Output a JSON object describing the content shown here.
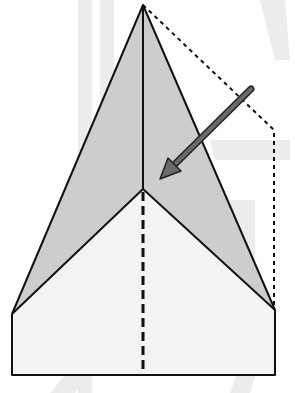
{
  "colors": {
    "background": "#ffffff",
    "watermark": "#ececec",
    "shaded_flap": "#cdcdcd",
    "paper": "#f3f3f3",
    "outline": "#111111",
    "arrow_fill": "#6a6a6a",
    "arrow_stroke": "#222222"
  },
  "shapes": {
    "apex": [
      143,
      5
    ],
    "center_point": [
      143,
      189
    ],
    "left_wing_corner": [
      12,
      314
    ],
    "right_wing_corner": [
      275,
      310
    ],
    "bottom_left": [
      12,
      375
    ],
    "bottom_right": [
      275,
      375
    ],
    "dotted_outline": [
      [
        143,
        5
      ],
      [
        274,
        130
      ],
      [
        274,
        310
      ]
    ],
    "center_crease_dashed": [
      [
        143,
        189
      ],
      [
        143,
        375
      ]
    ],
    "center_fold_solid": [
      [
        143,
        5
      ],
      [
        143,
        189
      ]
    ],
    "arrow": {
      "from": [
        251,
        89
      ],
      "to": [
        161,
        178
      ],
      "direction": "fold-in"
    }
  },
  "caption": "Fold right flap along dotted line toward center"
}
